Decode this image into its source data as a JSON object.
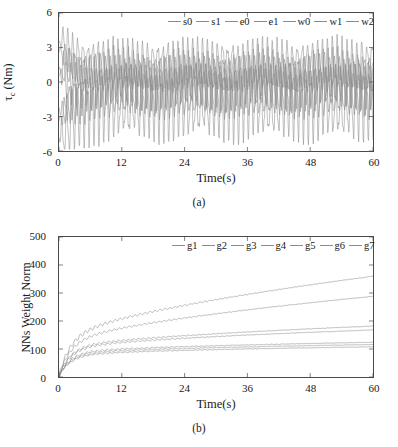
{
  "figure": {
    "panel_a_caption": "(a)",
    "panel_b_caption": "(b)"
  },
  "chart_data": [
    {
      "id": "panel-a",
      "type": "line",
      "title": "",
      "xlabel": "Time(s)",
      "ylabel": "τ_c (Nm)",
      "ylabel_parts": {
        "main": "τ",
        "sub": "c",
        "unit": " (Nm)"
      },
      "xlim": [
        0,
        60
      ],
      "ylim": [
        -6,
        6
      ],
      "xticks": [
        0,
        12,
        24,
        36,
        48,
        60
      ],
      "yticks": [
        -6,
        -3,
        0,
        3,
        6
      ],
      "xtick_labels": [
        "0",
        "12",
        "24",
        "36",
        "48",
        "60"
      ],
      "ytick_labels": [
        "-6",
        "-3",
        "0",
        "3",
        "6"
      ],
      "grid": false,
      "legend_position": "top-center",
      "legend": [
        "s0",
        "s1",
        "e0",
        "e1",
        "w0",
        "w1",
        "w2"
      ],
      "series": [
        {
          "name": "s0",
          "color": "#8c8c8c",
          "amplitude": 1.1,
          "offset": 0.9,
          "freq": 1.05,
          "phase": 0.0,
          "noise": 0.35,
          "settle": 2.4,
          "start": 2.6
        },
        {
          "name": "s1",
          "color": "#8c8c8c",
          "amplitude": 1.4,
          "offset": -0.6,
          "freq": 1.05,
          "phase": 0.9,
          "noise": 0.4,
          "settle": 2.0,
          "start": -3.4
        },
        {
          "name": "e0",
          "color": "#8c8c8c",
          "amplitude": 2.1,
          "offset": 0.2,
          "freq": 1.05,
          "phase": 1.8,
          "noise": 0.45,
          "settle": 2.2,
          "start": 1.2
        },
        {
          "name": "e1",
          "color": "#8c8c8c",
          "amplitude": 1.7,
          "offset": 1.6,
          "freq": 1.05,
          "phase": 2.7,
          "noise": 0.4,
          "settle": 1.8,
          "start": 3.6
        },
        {
          "name": "w0",
          "color": "#8c8c8c",
          "amplitude": 1.3,
          "offset": -1.4,
          "freq": 1.05,
          "phase": 3.6,
          "noise": 0.38,
          "settle": 2.6,
          "start": -2.2
        },
        {
          "name": "w1",
          "color": "#8c8c8c",
          "amplitude": 2.6,
          "offset": -1.9,
          "freq": 1.05,
          "phase": 4.5,
          "noise": 0.5,
          "settle": 2.1,
          "start": -4.8
        },
        {
          "name": "w2",
          "color": "#8c8c8c",
          "amplitude": 0.9,
          "offset": 0.4,
          "freq": 1.05,
          "phase": 5.4,
          "noise": 0.3,
          "settle": 2.8,
          "start": 0.6
        }
      ]
    },
    {
      "id": "panel-b",
      "type": "line",
      "title": "",
      "xlabel": "Time(s)",
      "ylabel": "NNs Weight Norm",
      "xlim": [
        0,
        60
      ],
      "ylim": [
        0,
        500
      ],
      "xticks": [
        0,
        12,
        24,
        36,
        48,
        60
      ],
      "yticks": [
        0,
        100,
        200,
        300,
        400,
        500
      ],
      "xtick_labels": [
        "0",
        "12",
        "24",
        "36",
        "48",
        "60"
      ],
      "ytick_labels": [
        "0",
        "100",
        "200",
        "300",
        "400",
        "500"
      ],
      "grid": false,
      "legend_position": "top-center",
      "legend": [
        "g1",
        "g2",
        "g3",
        "g4",
        "g5",
        "g6",
        "g7"
      ],
      "series": [
        {
          "name": "g1",
          "color": "#8c8c8c",
          "final": 360,
          "knee": 120,
          "ripple": 8,
          "shape": 0.62
        },
        {
          "name": "g2",
          "color": "#8c8c8c",
          "final": 288,
          "knee": 105,
          "ripple": 6,
          "shape": 0.6
        },
        {
          "name": "g3",
          "color": "#8c8c8c",
          "final": 182,
          "knee": 95,
          "ripple": 5,
          "shape": 0.55
        },
        {
          "name": "g4",
          "color": "#8c8c8c",
          "final": 168,
          "knee": 90,
          "ripple": 5,
          "shape": 0.52
        },
        {
          "name": "g5",
          "color": "#8c8c8c",
          "final": 124,
          "knee": 78,
          "ripple": 4,
          "shape": 0.45
        },
        {
          "name": "g6",
          "color": "#8c8c8c",
          "final": 116,
          "knee": 72,
          "ripple": 4,
          "shape": 0.42
        },
        {
          "name": "g7",
          "color": "#8c8c8c",
          "final": 108,
          "knee": 66,
          "ripple": 3,
          "shape": 0.4
        }
      ]
    }
  ]
}
